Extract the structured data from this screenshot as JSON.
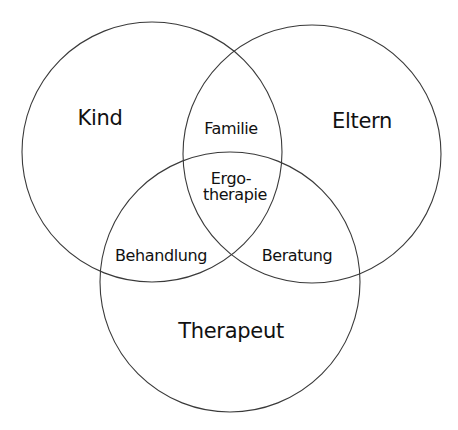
{
  "diagram": {
    "type": "venn",
    "circles": [
      {
        "id": "kind",
        "label": "Kind",
        "cx": 152,
        "cy": 152,
        "r": 130
      },
      {
        "id": "eltern",
        "label": "Eltern",
        "cx": 312,
        "cy": 154,
        "r": 129
      },
      {
        "id": "therapeut",
        "label": "Therapeut",
        "cx": 230,
        "cy": 282,
        "r": 130
      }
    ],
    "intersections": {
      "kind_eltern": "Familie",
      "kind_therapeut": "Behandlung",
      "eltern_therapeut": "Beratung",
      "center_line1": "Ergo-",
      "center_line2": "therapie"
    },
    "stroke_color": "#3a3a3a",
    "text_color": "#111111",
    "background": "#ffffff"
  }
}
